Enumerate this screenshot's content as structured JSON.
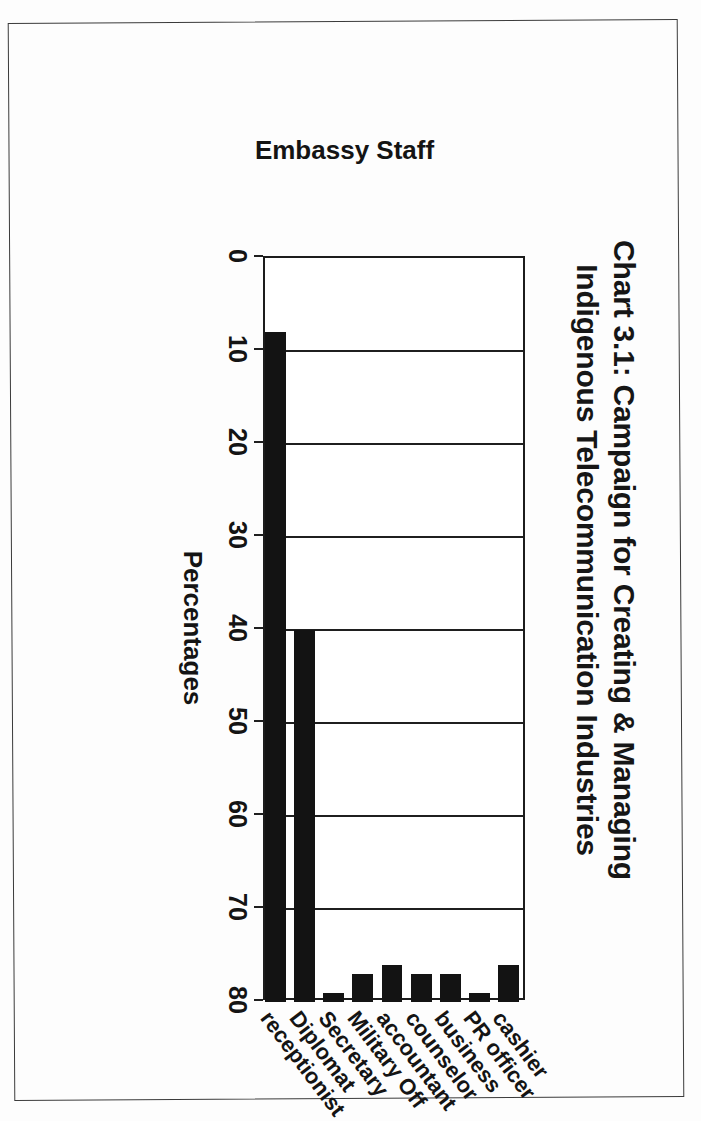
{
  "document": {
    "kind": "scanned-page",
    "background_color": "#fdfdfd",
    "border_color": "#3b3b3b"
  },
  "chart_data": {
    "type": "bar",
    "orientation": "vertical",
    "title": "Chart 3.1: Campaign for Creating & Managing Indigenous Telecommunication Industries",
    "title_line_1": "Chart 3.1: Campaign for Creating & Managing",
    "title_line_2": "Indigenous Telecommunication Industries",
    "xlabel": "Embassy Staff",
    "ylabel": "Percentages",
    "categories": [
      "cashier",
      "PR officer",
      "business",
      "counselor",
      "accountant",
      "Military Off",
      "Secretary",
      "Diplomat",
      "receptionist"
    ],
    "values": [
      4,
      1,
      3,
      3,
      4,
      3,
      1,
      40,
      72
    ],
    "ylim": [
      0,
      80
    ],
    "yticks": [
      0,
      10,
      20,
      30,
      40,
      50,
      60,
      70,
      80
    ],
    "ytick_labels": [
      "0",
      "10",
      "20",
      "30",
      "40",
      "50",
      "60",
      "70",
      "80"
    ],
    "grid": true,
    "legend": false,
    "bar_color": "#131313",
    "plot_border_color": "#1c1c1c"
  }
}
